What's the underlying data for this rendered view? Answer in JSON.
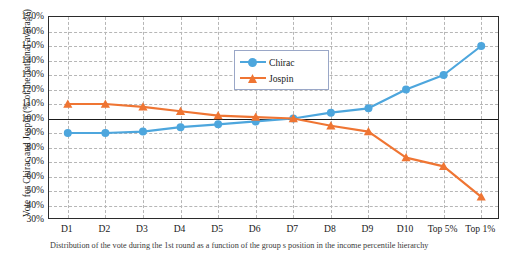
{
  "chart_data": {
    "type": "line",
    "title": "",
    "xlabel": "",
    "ylabel": "Vote for Chirac and Jospin (% of the national average)",
    "categories": [
      "D1",
      "D2",
      "D3",
      "D4",
      "D5",
      "D6",
      "D7",
      "D8",
      "D9",
      "D10",
      "Top 5%",
      "Top 1%"
    ],
    "series": [
      {
        "name": "Chirac",
        "color": "#4da6dd",
        "marker": "circle",
        "values": [
          90,
          90,
          91,
          94,
          96,
          98,
          100,
          104,
          107,
          120,
          130,
          150
        ]
      },
      {
        "name": "Jospin",
        "color": "#ef7533",
        "marker": "triangle",
        "values": [
          110,
          110,
          108,
          105,
          102,
          101,
          100,
          95,
          91,
          73,
          67,
          46
        ]
      }
    ],
    "ylim": [
      30,
      170
    ],
    "ytick_step": 10,
    "yticks": [
      "30%",
      "40%",
      "50%",
      "60%",
      "70%",
      "80%",
      "90%",
      "100%",
      "110%",
      "120%",
      "130%",
      "140%",
      "150%",
      "160%",
      "170%"
    ],
    "baseline_value": 100,
    "grid": true,
    "grid_style": "dashed",
    "legend_position": "inside-top-center",
    "legend": [
      "Chirac",
      "Jospin"
    ]
  },
  "caption": "Distribution of the vote during the 1st round as a function of the group s position in the income percentile hierarchy"
}
